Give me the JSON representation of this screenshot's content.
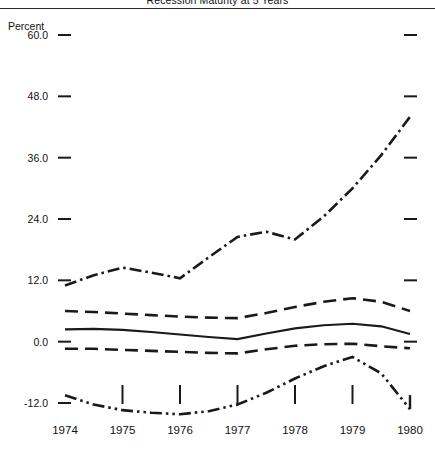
{
  "chart_title": "Recession Maturity at 5 Years",
  "y_axis_title": "Percent",
  "x_tick_labels": [
    "1974",
    "1975",
    "1976",
    "1977",
    "1978",
    "1979",
    "1980"
  ],
  "y_tick_labels": [
    "60.0",
    "48.0",
    "36.0",
    "24.0",
    "12.0",
    "0.0",
    "-12.0"
  ],
  "colors": {
    "ink": "#1a1a1a",
    "background": "#ffffff",
    "rule": "#2b2b2b"
  },
  "chart_data": {
    "type": "line",
    "title": "Recession Maturity at 5 Years",
    "xlabel": "",
    "ylabel": "Percent",
    "x": [
      1974,
      1975,
      1976,
      1977,
      1978,
      1979,
      1980
    ],
    "xlim": [
      1974,
      1980
    ],
    "ylim": [
      -12.0,
      60.0
    ],
    "yticks": [
      -12.0,
      0.0,
      12.0,
      24.0,
      36.0,
      48.0,
      60.0
    ],
    "ytick_labels": [
      "-12.0",
      "0.0",
      "12.0",
      "24.0",
      "36.0",
      "48.0",
      "60.0"
    ],
    "xticks": [
      1974,
      1975,
      1976,
      1977,
      1978,
      1979,
      1980
    ],
    "grid": false,
    "legend": "none",
    "series": [
      {
        "name": "Upper dash-dot series",
        "style": "dash-dot",
        "x": [
          1974.0,
          1974.5,
          1975.0,
          1975.5,
          1976.0,
          1976.5,
          1977.0,
          1977.5,
          1978.0,
          1978.5,
          1979.0,
          1979.5,
          1980.0
        ],
        "values": [
          11.0,
          13.0,
          14.5,
          13.5,
          12.4,
          16.5,
          20.5,
          21.5,
          20.0,
          24.5,
          30.0,
          36.5,
          44.0
        ]
      },
      {
        "name": "Upper confidence band",
        "style": "dashed",
        "x": [
          1974.0,
          1974.5,
          1975.0,
          1975.5,
          1976.0,
          1976.5,
          1977.0,
          1977.5,
          1978.0,
          1978.5,
          1979.0,
          1979.5,
          1980.0
        ],
        "values": [
          6.0,
          5.8,
          5.5,
          5.2,
          4.9,
          4.7,
          4.6,
          5.6,
          6.8,
          7.8,
          8.5,
          7.8,
          6.0
        ]
      },
      {
        "name": "Central estimate",
        "style": "solid",
        "x": [
          1974.0,
          1974.5,
          1975.0,
          1975.5,
          1976.0,
          1976.5,
          1977.0,
          1977.5,
          1978.0,
          1978.5,
          1979.0,
          1979.5,
          1980.0
        ],
        "values": [
          2.4,
          2.5,
          2.3,
          1.9,
          1.4,
          0.9,
          0.5,
          1.6,
          2.6,
          3.2,
          3.5,
          3.0,
          1.5
        ]
      },
      {
        "name": "Lower confidence band",
        "style": "dashed",
        "x": [
          1974.0,
          1974.5,
          1975.0,
          1975.5,
          1976.0,
          1976.5,
          1977.0,
          1977.5,
          1978.0,
          1978.5,
          1979.0,
          1979.5,
          1980.0
        ],
        "values": [
          -1.4,
          -1.4,
          -1.6,
          -1.8,
          -2.0,
          -2.2,
          -2.3,
          -1.5,
          -0.8,
          -0.5,
          -0.4,
          -0.9,
          -1.3
        ]
      },
      {
        "name": "Lower dash-dot-dot series",
        "style": "dash-dot-dot",
        "x": [
          1974.0,
          1974.5,
          1975.0,
          1975.5,
          1976.0,
          1976.5,
          1977.0,
          1977.5,
          1978.0,
          1978.5,
          1979.0,
          1979.5,
          1980.0
        ],
        "values": [
          -10.5,
          -12.3,
          -13.4,
          -13.9,
          -14.2,
          -13.6,
          -12.3,
          -10.0,
          -7.2,
          -4.8,
          -3.0,
          -6.2,
          -13.2
        ]
      }
    ]
  }
}
